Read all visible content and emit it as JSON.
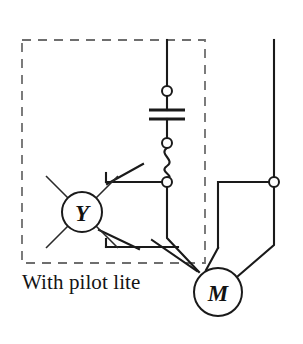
{
  "figure": {
    "title": "With pilot lite",
    "type": "electrical-wiring-diagram",
    "caption": "With pilot lite",
    "caption_x": 22,
    "caption_y": 272
  },
  "colors": {
    "wire": "#1a1a1a",
    "enclosure": "#6e6e6e",
    "background": "#ffffff",
    "text": "#141414"
  },
  "enclosure": {
    "name": "pilot-lite-enclosure",
    "style": "dashed",
    "x": 22,
    "y": 40,
    "width": 183,
    "height": 223
  },
  "devices": {
    "pilot_lamp": {
      "name": "pilot-lamp",
      "label": "Y",
      "cx": 82,
      "cy": 212,
      "r": 20,
      "font_size": 23,
      "rays": 8
    },
    "motor": {
      "name": "motor",
      "label": "M",
      "cx": 218,
      "cy": 292,
      "r": 24,
      "font_size": 23
    },
    "capacitor": {
      "name": "capacitor",
      "x": 167,
      "plate_top_y": 110,
      "plate_bottom_y": 119,
      "plate_half_width": 18
    },
    "overload": {
      "name": "thermal-overload-element",
      "x": 167,
      "y_top": 148,
      "y_bottom": 178
    }
  },
  "terminals": [
    {
      "name": "terminal-upper",
      "cx": 167,
      "cy": 91,
      "r": 5
    },
    {
      "name": "terminal-capacitor-lower",
      "cx": 167,
      "cy": 143,
      "r": 5
    },
    {
      "name": "terminal-contact-left",
      "cx": 167,
      "cy": 182,
      "r": 5
    },
    {
      "name": "terminal-right-line",
      "cx": 274,
      "cy": 182,
      "r": 5
    }
  ],
  "contacts": [
    {
      "name": "contact-upper-normally-open",
      "pivot_x": 106,
      "pivot_y": 182,
      "blade_end_x": 143,
      "blade_end_y": 166
    },
    {
      "name": "contact-lower-normally-open",
      "pivot_x": 106,
      "pivot_y": 247,
      "blade_end_x": 143,
      "blade_end_y": 232
    },
    {
      "name": "contact-right-normally-open",
      "pivot_x": 248,
      "pivot_y": 182,
      "blade_end_x": 276,
      "blade_end_y": 200
    }
  ],
  "labels": {
    "pilot_lamp_label": "Y",
    "motor_label": "M"
  }
}
